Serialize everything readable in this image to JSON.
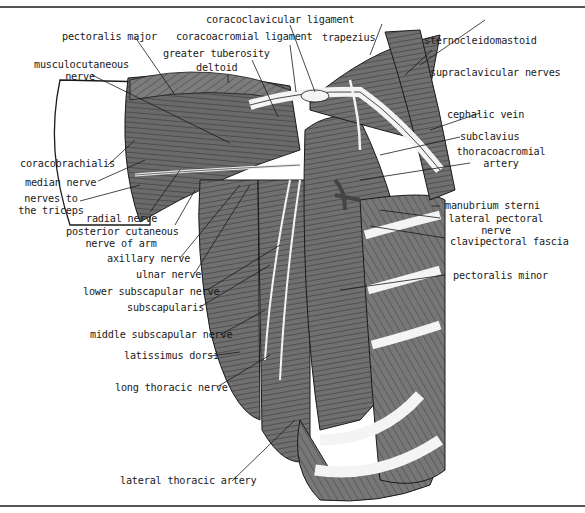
{
  "figure": {
    "labels": {
      "coracoclavicular_ligament": "coracoclavicular ligament",
      "pectoralis_major": "pectoralis major",
      "coracoacromial_ligament": "coracoacromial ligament",
      "trapezius": "trapezius",
      "sternocleidomastoid": "sternocleidomastoid",
      "greater_tuberosity": "greater tuberosity",
      "musculocutaneous_nerve_1": "musculocutaneous",
      "musculocutaneous_nerve_2": "nerve",
      "deltoid": "deltoid",
      "supraclavicular_nerves": "supraclavicular nerves",
      "cephalic_vein": "cephalic vein",
      "subclavius": "subclavius",
      "thoracoacromial_artery_1": "thoracoacromial",
      "thoracoacromial_artery_2": "artery",
      "coracobrachialis": "coracobrachialis",
      "median_nerve": "median nerve",
      "nerves_to_triceps_1": "nerves to",
      "nerves_to_triceps_2": "the triceps",
      "radial_nerve": "radial nerve",
      "posterior_cutaneous_1": "posterior cutaneous",
      "posterior_cutaneous_2": "nerve of arm",
      "manubrium_sterni": "manubrium sterni",
      "lateral_pectoral_nerve_1": "lateral pectoral",
      "lateral_pectoral_nerve_2": "nerve",
      "clavipectoral_fascia": "clavipectoral fascia",
      "axillary_nerve": "axillary nerve",
      "ulnar_nerve": "ulnar nerve",
      "pectoralis_minor": "pectoralis minor",
      "lower_subscapular_nerve": "lower subscapular nerve",
      "subscapularis": "subscapularis",
      "middle_subscapular_nerve": "middle subscapular nerve",
      "latissimus_dorsi": "latissimus dorsi",
      "long_thoracic_nerve": "long thoracic nerve",
      "lateral_thoracic_artery": "lateral thoracic artery"
    },
    "colors": {
      "muscle": "#6e6e6e",
      "muscle_light": "#8a8a8a",
      "muscle_dark": "#555555",
      "structure_white": "#f4f4f4",
      "outline": "#1a1a1a",
      "rule": "#555555"
    }
  }
}
